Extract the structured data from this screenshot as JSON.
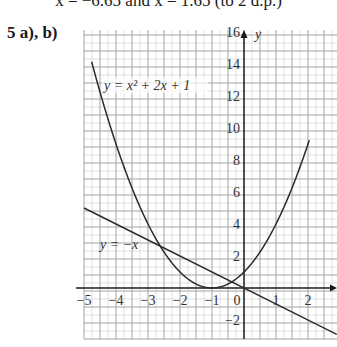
{
  "header": {
    "continuation_text": "x = −6.65 and x = 1.65 (to 2 d.p.)",
    "question_label": "5  a), b)"
  },
  "chart_data": {
    "type": "line",
    "title": "",
    "xlabel": "x",
    "ylabel": "y",
    "xlim": [
      -5,
      2.9
    ],
    "ylim": [
      -3.2,
      16.2
    ],
    "grid": true,
    "x_ticks": [
      -5,
      -4,
      -3,
      -2,
      -1,
      0,
      1,
      2
    ],
    "x_tick_labels": [
      "−5",
      "−4",
      "−3",
      "−2",
      "−1",
      "0",
      "1",
      "2"
    ],
    "y_ticks": [
      -2,
      2,
      4,
      6,
      8,
      10,
      12,
      14,
      16
    ],
    "y_tick_labels": [
      "−2",
      "2",
      "4",
      "6",
      "8",
      "10",
      "12",
      "14",
      "16"
    ],
    "series": [
      {
        "name": "y = x² + 2x + 1",
        "equation": "y = x^2 + 2x + 1",
        "label_text": "y = x² + 2x + 1",
        "x_range": [
          -5,
          2.05
        ],
        "vertex": [
          -1,
          0
        ],
        "y_intercept": 1
      },
      {
        "name": "y = −x",
        "equation": "y = -x",
        "label_text": "y = −x",
        "x_range": [
          -5,
          2.9
        ]
      }
    ],
    "intersections": [
      [
        -2.62,
        2.62
      ],
      [
        -0.38,
        0.38
      ]
    ],
    "annotations": [
      "y = x² + 2x + 1",
      "y = −x"
    ]
  },
  "colors": {
    "grid_major": "#9a9a9a",
    "grid_minor": "#cfcfcf",
    "axis": "#1a1a1a",
    "curve": "#2a2a2a"
  }
}
